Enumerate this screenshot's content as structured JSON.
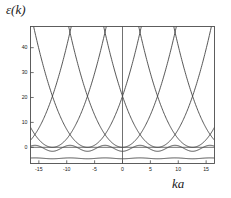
{
  "figure": {
    "axis_label_y": "ε(k)",
    "axis_label_x": "ka",
    "frame_color": "#4d4d4d",
    "curve_color": "#3a3a3a",
    "background": "#ffffff"
  },
  "chart_data": {
    "type": "line",
    "title": "",
    "subtitle": "",
    "xlabel": "ka",
    "ylabel": "ε(k)",
    "xlim": [
      -16.5,
      16.5
    ],
    "ylim": [
      -6.5,
      48.5
    ],
    "grid": false,
    "legend": "none",
    "annotations": [],
    "xticks": [
      -15,
      -10,
      -5,
      0,
      5,
      10,
      15
    ],
    "xtick_labels": [
      "-15",
      "-10",
      "-5",
      "0",
      "5",
      "10",
      "15"
    ],
    "yticks": [
      0,
      10,
      20,
      30,
      40
    ],
    "ytick_labels": [
      "0",
      "10",
      "20",
      "30",
      "40"
    ],
    "zone_period": 6.2832,
    "parabola_scale": 0.52,
    "parabola_centers": [
      -18.85,
      -12.566,
      -6.283,
      0,
      6.283,
      12.566,
      18.85
    ],
    "series": [
      {
        "name": "band-1-flat",
        "kind": "flat-band",
        "level": -4.6,
        "amplitude": 0.35,
        "period": 6.2832
      },
      {
        "name": "band-2-gapped",
        "kind": "cosine-band",
        "level": -1.6,
        "amplitude": 2.4,
        "period": 6.2832
      },
      {
        "name": "parabola-n0",
        "kind": "parabola",
        "center": 0
      },
      {
        "name": "parabola-n1-neg",
        "kind": "parabola",
        "center": -6.283
      },
      {
        "name": "parabola-n1-pos",
        "kind": "parabola",
        "center": 6.283
      },
      {
        "name": "parabola-n2-neg",
        "kind": "parabola",
        "center": -12.566
      },
      {
        "name": "parabola-n2-pos",
        "kind": "parabola",
        "center": 12.566
      },
      {
        "name": "parabola-n3-neg",
        "kind": "parabola",
        "center": -18.85
      },
      {
        "name": "parabola-n3-pos",
        "kind": "parabola",
        "center": 18.85
      }
    ]
  }
}
